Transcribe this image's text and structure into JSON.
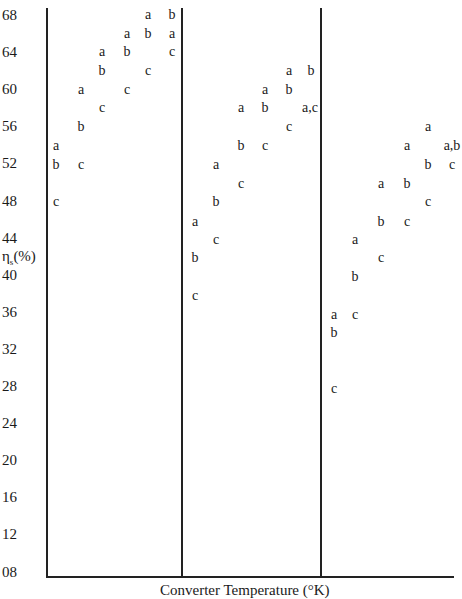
{
  "chart_data": {
    "type": "scatter",
    "title": "",
    "xlabel": "Converter Temperature (°K)",
    "ylabel": "ηs(%)",
    "ylim": [
      8,
      68
    ],
    "yticks": [
      "68",
      "64",
      "60",
      "56",
      "52",
      "48",
      "44",
      "40",
      "36",
      "32",
      "28",
      "24",
      "20",
      "16",
      "12",
      "08"
    ],
    "grid": false,
    "legend": "none (points labeled a, b, c)",
    "panels": [
      {
        "name": "panel-1",
        "columns": [
          {
            "a": 54,
            "b": 52,
            "c": 48
          },
          {
            "a": 60,
            "b": 56,
            "c": 52
          },
          {
            "a": 64,
            "b": 62,
            "c": 58
          },
          {
            "a": 66,
            "b": 64,
            "c": 60
          },
          {
            "a": 68,
            "b": 66,
            "c": 62
          },
          {
            "a": 66,
            "b": 68,
            "c": 64
          }
        ]
      },
      {
        "name": "panel-2",
        "columns": [
          {
            "a": 46,
            "b": 42,
            "c": 38
          },
          {
            "a": 52,
            "b": 48,
            "c": 44
          },
          {
            "a": 58,
            "b": 54,
            "c": 50
          },
          {
            "a": 60,
            "b": 58,
            "c": 54
          },
          {
            "a": 62,
            "b": 60,
            "c": 56
          },
          {
            "a": 58,
            "b": 62,
            "c": 58
          }
        ]
      },
      {
        "name": "panel-3",
        "columns": [
          {
            "a": 35.5,
            "b": 34,
            "c": 28
          },
          {
            "a": 44,
            "b": 40,
            "c": 36
          },
          {
            "a": 50,
            "b": 46,
            "c": 42
          },
          {
            "a": 54,
            "b": 50,
            "c": 46
          },
          {
            "a": 56,
            "b": 52,
            "c": 48
          },
          {
            "a": 54,
            "b": 54,
            "c": 52
          }
        ]
      }
    ]
  },
  "axis": {
    "ylabel_main": "η",
    "ylabel_sub": "s",
    "ylabel_unit": "(%)",
    "xlabel": "Converter Temperature (°K)"
  },
  "points": [
    {
      "t": "a",
      "x": 56,
      "y": 146
    },
    {
      "t": "b",
      "x": 56,
      "y": 165
    },
    {
      "t": "c",
      "x": 56,
      "y": 202
    },
    {
      "t": "a",
      "x": 81,
      "y": 90
    },
    {
      "t": "b",
      "x": 81,
      "y": 127
    },
    {
      "t": "c",
      "x": 81,
      "y": 165
    },
    {
      "t": "a",
      "x": 102,
      "y": 52
    },
    {
      "t": "b",
      "x": 102,
      "y": 71
    },
    {
      "t": "c",
      "x": 102,
      "y": 108
    },
    {
      "t": "a",
      "x": 127,
      "y": 34
    },
    {
      "t": "b",
      "x": 127,
      "y": 52
    },
    {
      "t": "c",
      "x": 127,
      "y": 90
    },
    {
      "t": "a",
      "x": 148,
      "y": 15
    },
    {
      "t": "b",
      "x": 148,
      "y": 34
    },
    {
      "t": "c",
      "x": 148,
      "y": 71
    },
    {
      "t": "b",
      "x": 172,
      "y": 15
    },
    {
      "t": "a",
      "x": 172,
      "y": 34
    },
    {
      "t": "c",
      "x": 172,
      "y": 52
    },
    {
      "t": "a",
      "x": 195,
      "y": 222
    },
    {
      "t": "b",
      "x": 195,
      "y": 258
    },
    {
      "t": "c",
      "x": 195,
      "y": 296
    },
    {
      "t": "a",
      "x": 216,
      "y": 165
    },
    {
      "t": "b",
      "x": 216,
      "y": 202
    },
    {
      "t": "c",
      "x": 216,
      "y": 240
    },
    {
      "t": "a",
      "x": 241,
      "y": 108
    },
    {
      "t": "b",
      "x": 241,
      "y": 146
    },
    {
      "t": "c",
      "x": 241,
      "y": 184
    },
    {
      "t": "a",
      "x": 265,
      "y": 90
    },
    {
      "t": "b",
      "x": 265,
      "y": 108
    },
    {
      "t": "c",
      "x": 265,
      "y": 146
    },
    {
      "t": "a",
      "x": 289,
      "y": 71
    },
    {
      "t": "b",
      "x": 289,
      "y": 90
    },
    {
      "t": "c",
      "x": 289,
      "y": 127
    },
    {
      "t": "b",
      "x": 311,
      "y": 71
    },
    {
      "t": "a,c",
      "x": 310,
      "y": 108
    },
    {
      "t": "a",
      "x": 334,
      "y": 315
    },
    {
      "t": "b",
      "x": 334,
      "y": 333
    },
    {
      "t": "c",
      "x": 334,
      "y": 389
    },
    {
      "t": "a",
      "x": 355,
      "y": 240
    },
    {
      "t": "b",
      "x": 355,
      "y": 277
    },
    {
      "t": "c",
      "x": 355,
      "y": 315
    },
    {
      "t": "a",
      "x": 381,
      "y": 184
    },
    {
      "t": "b",
      "x": 381,
      "y": 222
    },
    {
      "t": "c",
      "x": 381,
      "y": 258
    },
    {
      "t": "a",
      "x": 407,
      "y": 146
    },
    {
      "t": "b",
      "x": 407,
      "y": 184
    },
    {
      "t": "c",
      "x": 407,
      "y": 222
    },
    {
      "t": "a",
      "x": 428,
      "y": 127
    },
    {
      "t": "b",
      "x": 428,
      "y": 165
    },
    {
      "t": "c",
      "x": 428,
      "y": 202
    },
    {
      "t": "a,b",
      "x": 452,
      "y": 146
    },
    {
      "t": "c",
      "x": 452,
      "y": 165
    }
  ]
}
